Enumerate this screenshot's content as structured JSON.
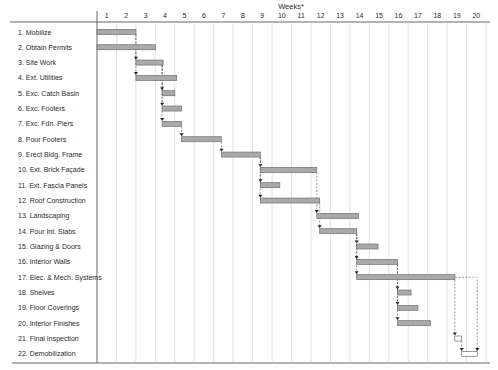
{
  "chart_data": {
    "type": "gantt",
    "title": "Weeks*",
    "xlabel": "Weeks*",
    "ylabel": "",
    "x_ticks": [
      "1",
      "2",
      "3",
      "4",
      "5",
      "6",
      "7",
      "8",
      "9",
      "10",
      "11",
      "12",
      "13",
      "14",
      "15",
      "16",
      "17",
      "18",
      "19",
      "20"
    ],
    "xlim": [
      0,
      20
    ],
    "grid": true,
    "legend": null,
    "tasks": [
      {
        "id": 1,
        "label": "1. Mobilize",
        "start": 0.0,
        "end": 2.0,
        "style": "filled"
      },
      {
        "id": 2,
        "label": "2. Obtain Permits",
        "start": 0.0,
        "end": 3.0,
        "style": "filled"
      },
      {
        "id": 3,
        "label": "3. Site Work",
        "start": 2.0,
        "end": 3.4,
        "style": "filled"
      },
      {
        "id": 4,
        "label": "4. Ext. Utilities",
        "start": 2.0,
        "end": 4.1,
        "style": "filled"
      },
      {
        "id": 5,
        "label": "5. Exc. Catch Basin",
        "start": 3.35,
        "end": 4.0,
        "style": "filled"
      },
      {
        "id": 6,
        "label": "6. Exc. Footers",
        "start": 3.35,
        "end": 4.35,
        "style": "filled"
      },
      {
        "id": 7,
        "label": "7. Exc. Fdn. Piers",
        "start": 3.35,
        "end": 4.35,
        "style": "filled"
      },
      {
        "id": 8,
        "label": "8. Pour Footers",
        "start": 4.35,
        "end": 6.4,
        "style": "filled"
      },
      {
        "id": 9,
        "label": "9. Erect Bldg. Frame",
        "start": 6.4,
        "end": 8.4,
        "style": "filled"
      },
      {
        "id": 10,
        "label": "10. Ext. Brick Façade",
        "start": 8.4,
        "end": 11.3,
        "style": "filled"
      },
      {
        "id": 11,
        "label": "11. Ext. Fascia Panels",
        "start": 8.4,
        "end": 9.4,
        "style": "filled"
      },
      {
        "id": 12,
        "label": "12. Roof Construction",
        "start": 8.4,
        "end": 11.45,
        "style": "filled"
      },
      {
        "id": 13,
        "label": "13. Landscaping",
        "start": 11.3,
        "end": 13.45,
        "style": "filled"
      },
      {
        "id": 14,
        "label": "14. Pour Int. Slabs",
        "start": 11.45,
        "end": 13.35,
        "style": "filled"
      },
      {
        "id": 15,
        "label": "15. Glazing & Doors",
        "start": 13.35,
        "end": 14.45,
        "style": "filled"
      },
      {
        "id": 16,
        "label": "16. Interior Walls",
        "start": 13.35,
        "end": 15.45,
        "style": "filled"
      },
      {
        "id": 17,
        "label": "17. Elec. & Mech. Systems",
        "start": 13.35,
        "end": 18.4,
        "style": "filled",
        "float_to": 19.55
      },
      {
        "id": 18,
        "label": "18. Shelves",
        "start": 15.45,
        "end": 16.15,
        "style": "filled"
      },
      {
        "id": 19,
        "label": "19. Floor Coverings",
        "start": 15.45,
        "end": 16.5,
        "style": "filled"
      },
      {
        "id": 20,
        "label": "20. Interior Finishes",
        "start": 15.45,
        "end": 17.15,
        "style": "filled"
      },
      {
        "id": 21,
        "label": "21. Final Inspection",
        "start": 18.4,
        "end": 18.75,
        "style": "hollow"
      },
      {
        "id": 22,
        "label": "22. Demobilization",
        "start": 18.75,
        "end": 19.55,
        "style": "hollow"
      }
    ],
    "dependencies": [
      {
        "from": 1,
        "to": 3
      },
      {
        "from": 1,
        "to": 4
      },
      {
        "from": 3,
        "to": 5
      },
      {
        "from": 3,
        "to": 6
      },
      {
        "from": 3,
        "to": 7
      },
      {
        "from": 7,
        "to": 8
      },
      {
        "from": 8,
        "to": 9
      },
      {
        "from": 9,
        "to": 10
      },
      {
        "from": 9,
        "to": 11
      },
      {
        "from": 9,
        "to": 12
      },
      {
        "from": 10,
        "to": 13
      },
      {
        "from": 12,
        "to": 14
      },
      {
        "from": 14,
        "to": 15
      },
      {
        "from": 14,
        "to": 16
      },
      {
        "from": 14,
        "to": 17
      },
      {
        "from": 16,
        "to": 18
      },
      {
        "from": 16,
        "to": 19
      },
      {
        "from": 16,
        "to": 20
      },
      {
        "from": 17,
        "to": 21
      },
      {
        "from": 21,
        "to": 22
      },
      {
        "from": 17,
        "to": 22
      }
    ],
    "colors": {
      "bar_fill": "#a9a9a9",
      "bar_stroke": "#6f6f6f",
      "hollow_fill": "#ffffff",
      "grid": "#cfcfcf",
      "axis": "#555555",
      "arrow": "#222222"
    }
  }
}
